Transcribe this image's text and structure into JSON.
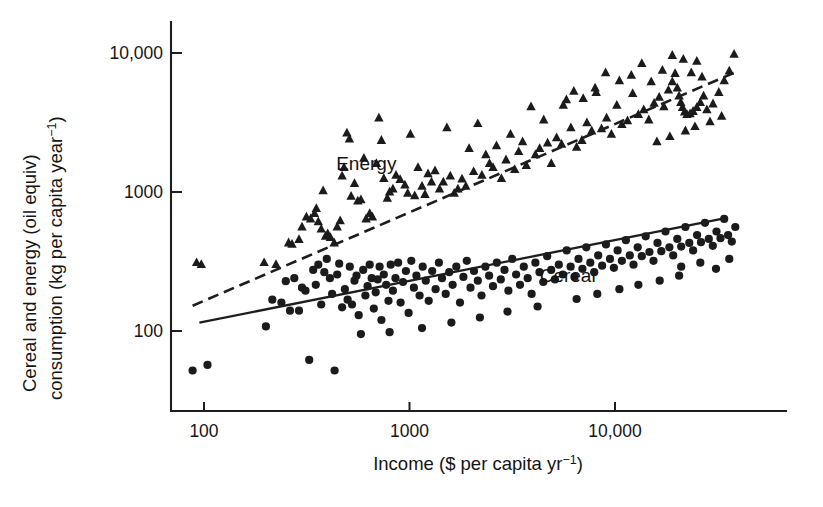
{
  "chart_data": {
    "type": "scatter",
    "title": "",
    "xlabel": "Income ($ per capita yr⁻¹)",
    "ylabel": "Cereal and energy (oil equiv) consumption (kg per capita year⁻¹)",
    "ylabel_line1": "Cereal and energy (oil equiv)",
    "ylabel_line2": "consumption (kg per capita year⁻¹)",
    "xscale": "log",
    "yscale": "log",
    "xlim": [
      85,
      45000
    ],
    "ylim": [
      42,
      14000
    ],
    "xticks": [
      100,
      1000,
      10000
    ],
    "xticklabels": [
      "100",
      "1000",
      "10,000"
    ],
    "yticks": [
      100,
      1000,
      10000
    ],
    "yticklabels": [
      "100",
      "1000",
      "10,000"
    ],
    "grid": false,
    "legend_position": "inline-annotations",
    "annotations": [
      {
        "text": "Energy",
        "x": 440,
        "y": 1430
      },
      {
        "text": "Cereal",
        "x": 4300,
        "y": 225
      }
    ],
    "series": [
      {
        "name": "Energy",
        "marker": "triangle",
        "color": "#1b1b1b",
        "trendline": {
          "style": "dashed",
          "x": [
            88,
            38000
          ],
          "y": [
            152,
            7200
          ]
        },
        "points": [
          [
            92,
            310
          ],
          [
            97,
            300
          ],
          [
            196,
            310
          ],
          [
            224,
            300
          ],
          [
            258,
            430
          ],
          [
            268,
            420
          ],
          [
            290,
            455
          ],
          [
            300,
            560
          ],
          [
            315,
            660
          ],
          [
            330,
            640
          ],
          [
            345,
            700
          ],
          [
            352,
            760
          ],
          [
            360,
            610
          ],
          [
            372,
            540
          ],
          [
            380,
            1020
          ],
          [
            390,
            480
          ],
          [
            400,
            500
          ],
          [
            412,
            470
          ],
          [
            430,
            430
          ],
          [
            445,
            560
          ],
          [
            460,
            620
          ],
          [
            470,
            1300
          ],
          [
            480,
            1500
          ],
          [
            496,
            2650
          ],
          [
            510,
            2400
          ],
          [
            520,
            930
          ],
          [
            540,
            1150
          ],
          [
            560,
            860
          ],
          [
            580,
            880
          ],
          [
            600,
            1750
          ],
          [
            615,
            640
          ],
          [
            640,
            700
          ],
          [
            660,
            660
          ],
          [
            690,
            1600
          ],
          [
            710,
            3400
          ],
          [
            730,
            2350
          ],
          [
            750,
            1250
          ],
          [
            780,
            900
          ],
          [
            800,
            1000
          ],
          [
            830,
            1050
          ],
          [
            860,
            1320
          ],
          [
            900,
            1230
          ],
          [
            950,
            1120
          ],
          [
            980,
            980
          ],
          [
            1010,
            2600
          ],
          [
            1060,
            940
          ],
          [
            1100,
            1500
          ],
          [
            1150,
            1100
          ],
          [
            1190,
            960
          ],
          [
            1230,
            1350
          ],
          [
            1280,
            1180
          ],
          [
            1330,
            1420
          ],
          [
            1400,
            1050
          ],
          [
            1460,
            1180
          ],
          [
            1520,
            2900
          ],
          [
            1580,
            1300
          ],
          [
            1650,
            980
          ],
          [
            1720,
            1050
          ],
          [
            1800,
            1240
          ],
          [
            1880,
            1100
          ],
          [
            1950,
            2050
          ],
          [
            2050,
            1400
          ],
          [
            2150,
            3100
          ],
          [
            2250,
            1320
          ],
          [
            2350,
            1850
          ],
          [
            2450,
            1600
          ],
          [
            2550,
            1500
          ],
          [
            2650,
            2150
          ],
          [
            2800,
            1250
          ],
          [
            2950,
            1700
          ],
          [
            3100,
            2600
          ],
          [
            3250,
            1450
          ],
          [
            3400,
            1950
          ],
          [
            3550,
            2300
          ],
          [
            3700,
            1550
          ],
          [
            3900,
            4100
          ],
          [
            4100,
            1850
          ],
          [
            4300,
            2050
          ],
          [
            4500,
            3300
          ],
          [
            4700,
            2250
          ],
          [
            4900,
            1600
          ],
          [
            5200,
            2450
          ],
          [
            5500,
            2200
          ],
          [
            5800,
            4600
          ],
          [
            6100,
            2900
          ],
          [
            6500,
            2100
          ],
          [
            6900,
            2350
          ],
          [
            7300,
            3150
          ],
          [
            7700,
            2750
          ],
          [
            8100,
            5200
          ],
          [
            8600,
            2850
          ],
          [
            9100,
            3400
          ],
          [
            9600,
            2600
          ],
          [
            10200,
            4200
          ],
          [
            10800,
            3050
          ],
          [
            11500,
            3250
          ],
          [
            12200,
            5100
          ],
          [
            13000,
            3600
          ],
          [
            13800,
            3900
          ],
          [
            14600,
            3300
          ],
          [
            15500,
            4350
          ],
          [
            16400,
            4800
          ],
          [
            17300,
            4100
          ],
          [
            18200,
            5400
          ],
          [
            19000,
            6200
          ],
          [
            19600,
            7100
          ],
          [
            20100,
            5600
          ],
          [
            20500,
            4900
          ],
          [
            20900,
            4400
          ],
          [
            21300,
            4050
          ],
          [
            21800,
            3750
          ],
          [
            22400,
            3600
          ],
          [
            23200,
            3650
          ],
          [
            24000,
            3800
          ],
          [
            25000,
            4050
          ],
          [
            26000,
            4400
          ],
          [
            27000,
            4900
          ],
          [
            26500,
            6700
          ],
          [
            25000,
            8700
          ],
          [
            23500,
            7200
          ],
          [
            21500,
            9000
          ],
          [
            19000,
            9600
          ],
          [
            17000,
            7500
          ],
          [
            15000,
            6200
          ],
          [
            13500,
            8400
          ],
          [
            12000,
            6900
          ],
          [
            10500,
            6300
          ],
          [
            9000,
            7200
          ],
          [
            8000,
            5600
          ],
          [
            7000,
            4700
          ],
          [
            6300,
            5300
          ],
          [
            5600,
            4200
          ],
          [
            28000,
            3900
          ],
          [
            30000,
            4300
          ],
          [
            32000,
            5200
          ],
          [
            34000,
            6300
          ],
          [
            36000,
            7400
          ],
          [
            38000,
            9800
          ],
          [
            33000,
            3500
          ],
          [
            29000,
            3200
          ],
          [
            24500,
            2950
          ],
          [
            22000,
            2750
          ],
          [
            18500,
            2500
          ],
          [
            16000,
            2300
          ]
        ]
      },
      {
        "name": "Cereal",
        "marker": "circle",
        "color": "#1b1b1b",
        "trendline": {
          "style": "solid",
          "x": [
            95,
            33000
          ],
          "y": [
            115,
            640
          ]
        },
        "points": [
          [
            88,
            52
          ],
          [
            104,
            57
          ],
          [
            200,
            108
          ],
          [
            215,
            168
          ],
          [
            238,
            160
          ],
          [
            250,
            228
          ],
          [
            262,
            140
          ],
          [
            275,
            240
          ],
          [
            290,
            140
          ],
          [
            300,
            205
          ],
          [
            312,
            195
          ],
          [
            325,
            62
          ],
          [
            340,
            275
          ],
          [
            350,
            215
          ],
          [
            360,
            300
          ],
          [
            372,
            155
          ],
          [
            385,
            265
          ],
          [
            396,
            330
          ],
          [
            410,
            240
          ],
          [
            420,
            185
          ],
          [
            432,
            52
          ],
          [
            445,
            255
          ],
          [
            455,
            305
          ],
          [
            470,
            148
          ],
          [
            485,
            200
          ],
          [
            500,
            168
          ],
          [
            512,
            290
          ],
          [
            525,
            155
          ],
          [
            540,
            230
          ],
          [
            552,
            250
          ],
          [
            566,
            130
          ],
          [
            580,
            95
          ],
          [
            595,
            275
          ],
          [
            610,
            180
          ],
          [
            625,
            210
          ],
          [
            640,
            300
          ],
          [
            655,
            240
          ],
          [
            670,
            145
          ],
          [
            685,
            190
          ],
          [
            700,
            235
          ],
          [
            715,
            290
          ],
          [
            730,
            120
          ],
          [
            750,
            255
          ],
          [
            770,
            215
          ],
          [
            790,
            165
          ],
          [
            810,
            300
          ],
          [
            830,
            195
          ],
          [
            855,
            240
          ],
          [
            880,
            310
          ],
          [
            905,
            160
          ],
          [
            930,
            225
          ],
          [
            960,
            270
          ],
          [
            990,
            135
          ],
          [
            1020,
            320
          ],
          [
            1050,
            205
          ],
          [
            1080,
            250
          ],
          [
            1120,
            180
          ],
          [
            1160,
            290
          ],
          [
            1200,
            230
          ],
          [
            1240,
            165
          ],
          [
            1290,
            270
          ],
          [
            1340,
            200
          ],
          [
            1390,
            310
          ],
          [
            1440,
            240
          ],
          [
            1500,
            185
          ],
          [
            1560,
            265
          ],
          [
            1620,
            215
          ],
          [
            1690,
            290
          ],
          [
            1760,
            160
          ],
          [
            1830,
            245
          ],
          [
            1900,
            320
          ],
          [
            1980,
            205
          ],
          [
            2060,
            270
          ],
          [
            2150,
            230
          ],
          [
            2240,
            180
          ],
          [
            2340,
            290
          ],
          [
            2440,
            250
          ],
          [
            2550,
            210
          ],
          [
            2660,
            310
          ],
          [
            2780,
            235
          ],
          [
            2900,
            275
          ],
          [
            3030,
            195
          ],
          [
            3160,
            330
          ],
          [
            3300,
            255
          ],
          [
            3450,
            215
          ],
          [
            3600,
            290
          ],
          [
            3760,
            240
          ],
          [
            3930,
            185
          ],
          [
            4100,
            310
          ],
          [
            4290,
            265
          ],
          [
            4480,
            225
          ],
          [
            4680,
            345
          ],
          [
            4890,
            275
          ],
          [
            5100,
            235
          ],
          [
            5330,
            300
          ],
          [
            5570,
            255
          ],
          [
            5820,
            380
          ],
          [
            6080,
            290
          ],
          [
            6350,
            245
          ],
          [
            6640,
            330
          ],
          [
            6940,
            280
          ],
          [
            7250,
            400
          ],
          [
            7580,
            310
          ],
          [
            7920,
            265
          ],
          [
            8280,
            350
          ],
          [
            8650,
            295
          ],
          [
            9040,
            420
          ],
          [
            9450,
            330
          ],
          [
            9880,
            285
          ],
          [
            10300,
            380
          ],
          [
            10800,
            320
          ],
          [
            11300,
            450
          ],
          [
            11800,
            350
          ],
          [
            12300,
            300
          ],
          [
            12900,
            400
          ],
          [
            13500,
            345
          ],
          [
            14100,
            480
          ],
          [
            14700,
            370
          ],
          [
            15400,
            320
          ],
          [
            16100,
            430
          ],
          [
            16800,
            375
          ],
          [
            17600,
            520
          ],
          [
            18400,
            400
          ],
          [
            19200,
            350
          ],
          [
            20100,
            460
          ],
          [
            21000,
            405
          ],
          [
            22000,
            560
          ],
          [
            23000,
            430
          ],
          [
            24000,
            380
          ],
          [
            25100,
            490
          ],
          [
            26200,
            435
          ],
          [
            27400,
            600
          ],
          [
            28600,
            460
          ],
          [
            29900,
            410
          ],
          [
            31200,
            520
          ],
          [
            32600,
            465
          ],
          [
            34000,
            640
          ],
          [
            35500,
            490
          ],
          [
            37000,
            440
          ],
          [
            38500,
            560
          ],
          [
            6500,
            170
          ],
          [
            8200,
            185
          ],
          [
            10500,
            200
          ],
          [
            13000,
            215
          ],
          [
            16500,
            230
          ],
          [
            20500,
            250
          ],
          [
            4200,
            150
          ],
          [
            3000,
            138
          ],
          [
            2200,
            125
          ],
          [
            1600,
            115
          ],
          [
            1150,
            105
          ],
          [
            800,
            98
          ],
          [
            21000,
            290
          ],
          [
            26000,
            310
          ],
          [
            31000,
            280
          ],
          [
            36000,
            330
          ]
        ]
      }
    ]
  },
  "axes": {
    "x_tick_labels": [
      "100",
      "1000",
      "10,000"
    ],
    "y_tick_labels": [
      "100",
      "1000",
      "10,000"
    ],
    "x_title_main": "Income ($ per capita yr",
    "x_title_exp": "−1",
    "x_title_tail": ")",
    "y_title_line1": "Cereal and energy (oil equiv)",
    "y_title_line2_main": "consumption (kg per capita year",
    "y_title_line2_exp": "−1",
    "y_title_line2_tail": ")"
  },
  "labels": {
    "energy": "Energy",
    "cereal": "Cereal"
  },
  "colors": {
    "ink": "#1b1b1b",
    "background": "#ffffff"
  }
}
